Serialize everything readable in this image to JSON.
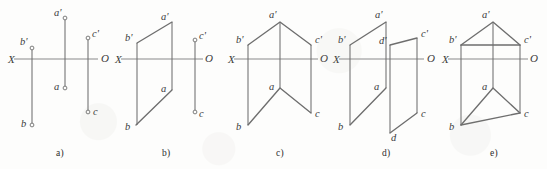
{
  "figure": {
    "width": 547,
    "height": 169,
    "background_color": "#fdfdfc",
    "line_color": "#6e6e6e",
    "axis_color": "#8a8a8a",
    "text_color": "#3a3a3a",
    "axis_labels": {
      "left": "X",
      "right": "O"
    }
  },
  "captions": [
    {
      "id": "cap-a",
      "label": "a)",
      "x": 56,
      "y": 148
    },
    {
      "id": "cap-b",
      "label": "b)",
      "x": 162,
      "y": 148
    },
    {
      "id": "cap-c",
      "label": "c)",
      "x": 276,
      "y": 148
    },
    {
      "id": "cap-d",
      "label": "d)",
      "x": 382,
      "y": 148
    },
    {
      "id": "cap-e",
      "label": "e)",
      "x": 490,
      "y": 148
    }
  ],
  "panels": [
    {
      "id": "panel-a",
      "caption": "a)",
      "axis": {
        "x1": 8,
        "x2": 98,
        "y": 59
      },
      "axis_label_left": {
        "text": "X",
        "x": 8,
        "y": 63
      },
      "axis_label_right": {
        "text": "O",
        "x": 101,
        "y": 62
      },
      "vertical_lines": [
        {
          "name": "b-prime-to-b",
          "x": 32,
          "y1": 48,
          "y2": 125
        },
        {
          "name": "a-prime-to-a",
          "x": 65,
          "y1": 18,
          "y2": 88
        },
        {
          "name": "c-prime-to-c",
          "x": 88,
          "y1": 38,
          "y2": 112
        }
      ],
      "polylines": [],
      "points": [
        {
          "name": "a-prime",
          "label": "a'",
          "x": 65,
          "y": 18,
          "lx": 54,
          "ly": 16
        },
        {
          "name": "b-prime",
          "label": "b'",
          "x": 32,
          "y": 48,
          "lx": 20,
          "ly": 45
        },
        {
          "name": "c-prime",
          "label": "c'",
          "x": 88,
          "y": 38,
          "lx": 92,
          "ly": 37
        },
        {
          "name": "a",
          "label": "a",
          "x": 65,
          "y": 88,
          "lx": 54,
          "ly": 90
        },
        {
          "name": "b",
          "label": "b",
          "x": 32,
          "y": 125,
          "lx": 21,
          "ly": 127
        },
        {
          "name": "c",
          "label": "c",
          "x": 88,
          "y": 112,
          "lx": 93,
          "ly": 115
        }
      ]
    },
    {
      "id": "panel-b",
      "caption": "b)",
      "axis": {
        "x1": 115,
        "x2": 203,
        "y": 59
      },
      "axis_label_left": {
        "text": "X",
        "x": 115,
        "y": 63
      },
      "axis_label_right": {
        "text": "O",
        "x": 205,
        "y": 62
      },
      "vertical_lines": [
        {
          "name": "b-prime-to-b",
          "x": 137,
          "y1": 43,
          "y2": 125
        },
        {
          "name": "a-prime-to-a",
          "x": 172,
          "y1": 22,
          "y2": 90
        },
        {
          "name": "c-prime-to-c",
          "x": 195,
          "y1": 40,
          "y2": 112
        }
      ],
      "polylines": [
        {
          "name": "upper-edge-b-prime-a-prime",
          "points": "137,43 172,22"
        },
        {
          "name": "lower-edge-b-a",
          "points": "136,125 172,90"
        }
      ],
      "points": [
        {
          "name": "a-prime",
          "label": "a'",
          "x": 172,
          "y": 22,
          "lx": 161,
          "ly": 20
        },
        {
          "name": "b-prime",
          "label": "b'",
          "x": 137,
          "y": 43,
          "lx": 125,
          "ly": 41
        },
        {
          "name": "c-prime",
          "label": "c'",
          "x": 195,
          "y": 40,
          "lx": 199,
          "ly": 39
        },
        {
          "name": "a",
          "label": "a",
          "x": 172,
          "y": 90,
          "lx": 161,
          "ly": 92
        },
        {
          "name": "b",
          "label": "b",
          "x": 136,
          "y": 125,
          "lx": 125,
          "ly": 130
        },
        {
          "name": "c",
          "label": "c",
          "x": 195,
          "y": 112,
          "lx": 199,
          "ly": 117
        }
      ]
    },
    {
      "id": "panel-c",
      "caption": "c)",
      "axis": {
        "x1": 228,
        "x2": 318,
        "y": 59
      },
      "axis_label_left": {
        "text": "X",
        "x": 228,
        "y": 63
      },
      "axis_label_right": {
        "text": "O",
        "x": 320,
        "y": 62
      },
      "vertical_lines": [
        {
          "name": "b-prime-to-b",
          "x": 248,
          "y1": 45,
          "y2": 125
        },
        {
          "name": "a-prime-to-a",
          "x": 280,
          "y1": 22,
          "y2": 88
        },
        {
          "name": "c-prime-to-c",
          "x": 311,
          "y1": 45,
          "y2": 113
        }
      ],
      "polylines": [
        {
          "name": "upper-roof-b-prime-a-prime-c-prime",
          "points": "248,45 280,22 311,45"
        },
        {
          "name": "lower-vee-b-a-c",
          "points": "248,125 280,88 311,113"
        }
      ],
      "points": [
        {
          "name": "a-prime",
          "label": "a'",
          "x": 280,
          "y": 22,
          "lx": 269,
          "ly": 18
        },
        {
          "name": "b-prime",
          "label": "b'",
          "x": 248,
          "y": 45,
          "lx": 236,
          "ly": 43
        },
        {
          "name": "c-prime",
          "label": "c'",
          "x": 311,
          "y": 45,
          "lx": 315,
          "ly": 43
        },
        {
          "name": "a",
          "label": "a",
          "x": 280,
          "y": 88,
          "lx": 269,
          "ly": 90
        },
        {
          "name": "b",
          "label": "b",
          "x": 248,
          "y": 125,
          "lx": 236,
          "ly": 130
        },
        {
          "name": "c",
          "label": "c",
          "x": 311,
          "y": 113,
          "lx": 315,
          "ly": 117
        }
      ]
    },
    {
      "id": "panel-d",
      "caption": "d)",
      "axis": {
        "x1": 333,
        "x2": 424,
        "y": 59
      },
      "axis_label_left": {
        "text": "X",
        "x": 333,
        "y": 63
      },
      "axis_label_right": {
        "text": "O",
        "x": 427,
        "y": 62
      },
      "vertical_lines": [
        {
          "name": "b-prime-to-b",
          "x": 350,
          "y1": 45,
          "y2": 125
        },
        {
          "name": "a-prime-to-a",
          "x": 386,
          "y1": 22,
          "y2": 88
        },
        {
          "name": "d-prime-to-d",
          "x": 390,
          "y1": 45,
          "y2": 133
        },
        {
          "name": "c-prime-to-c",
          "x": 417,
          "y1": 38,
          "y2": 113
        }
      ],
      "polylines": [
        {
          "name": "upper-edge-b-prime-a-prime",
          "points": "350,45 386,22"
        },
        {
          "name": "upper-edge-d-prime-c-prime",
          "points": "390,45 417,38"
        },
        {
          "name": "lower-edge-b-a",
          "points": "350,125 386,88"
        },
        {
          "name": "lower-edge-d-c",
          "points": "390,133 417,113"
        }
      ],
      "points": [
        {
          "name": "a-prime",
          "label": "a'",
          "x": 386,
          "y": 22,
          "lx": 375,
          "ly": 18
        },
        {
          "name": "b-prime",
          "label": "b'",
          "x": 350,
          "y": 45,
          "lx": 338,
          "ly": 43
        },
        {
          "name": "c-prime",
          "label": "c'",
          "x": 417,
          "y": 38,
          "lx": 421,
          "ly": 37
        },
        {
          "name": "d-prime",
          "label": "d'",
          "x": 390,
          "y": 45,
          "lx": 379,
          "ly": 44
        },
        {
          "name": "a",
          "label": "a",
          "x": 386,
          "y": 88,
          "lx": 374,
          "ly": 90
        },
        {
          "name": "b",
          "label": "b",
          "x": 350,
          "y": 125,
          "lx": 338,
          "ly": 130
        },
        {
          "name": "c",
          "label": "c",
          "x": 417,
          "y": 113,
          "lx": 421,
          "ly": 117
        },
        {
          "name": "d",
          "label": "d",
          "x": 390,
          "y": 133,
          "lx": 391,
          "ly": 141
        }
      ]
    },
    {
      "id": "panel-e",
      "caption": "e)",
      "axis": {
        "x1": 442,
        "x2": 528,
        "y": 59
      },
      "axis_label_left": {
        "text": "X",
        "x": 442,
        "y": 63
      },
      "axis_label_right": {
        "text": "O",
        "x": 530,
        "y": 62
      },
      "vertical_lines": [
        {
          "name": "b-prime-to-b",
          "x": 461,
          "y1": 45,
          "y2": 125
        },
        {
          "name": "a-prime-to-a",
          "x": 493,
          "y1": 22,
          "y2": 88
        },
        {
          "name": "c-prime-to-c",
          "x": 520,
          "y1": 45,
          "y2": 113
        }
      ],
      "polylines": [
        {
          "name": "upper-roof-b-prime-a-prime-c-prime",
          "points": "461,45 493,22 520,45"
        },
        {
          "name": "upper-base-b-prime-c-prime",
          "points": "461,45 520,45"
        },
        {
          "name": "lower-vee-b-a-c",
          "points": "461,125 493,88 520,113"
        },
        {
          "name": "lower-base-b-c",
          "points": "461,125 520,113"
        }
      ],
      "points": [
        {
          "name": "a-prime",
          "label": "a'",
          "x": 493,
          "y": 22,
          "lx": 482,
          "ly": 18
        },
        {
          "name": "b-prime",
          "label": "b'",
          "x": 461,
          "y": 45,
          "lx": 449,
          "ly": 43
        },
        {
          "name": "c-prime",
          "label": "c'",
          "x": 520,
          "y": 45,
          "lx": 524,
          "ly": 43
        },
        {
          "name": "a",
          "label": "a",
          "x": 493,
          "y": 88,
          "lx": 482,
          "ly": 90
        },
        {
          "name": "b",
          "label": "b",
          "x": 461,
          "y": 125,
          "lx": 449,
          "ly": 130
        },
        {
          "name": "c",
          "label": "c",
          "x": 520,
          "y": 113,
          "lx": 524,
          "ly": 117
        }
      ]
    }
  ]
}
